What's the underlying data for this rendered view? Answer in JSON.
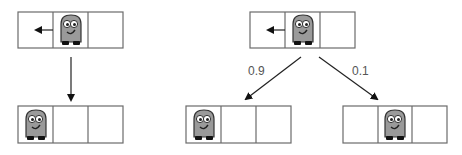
{
  "colors": {
    "grid_line": "#6b6b6b",
    "arrow": "#222222",
    "robot_body": "#9a9a9a",
    "robot_outline": "#333333",
    "robot_feet": "#111111",
    "label_text": "#555555"
  },
  "diagram": {
    "left_transition": {
      "start_state": {
        "robot_cell": 2,
        "action": "move-left"
      },
      "end_state": {
        "robot_cell": 1
      },
      "probability_label": ""
    },
    "right_transition": {
      "start_state": {
        "robot_cell": 2,
        "action": "move-left"
      },
      "outcomes": [
        {
          "robot_cell": 1,
          "probability": "0.9"
        },
        {
          "robot_cell": 2,
          "probability": "0.1"
        }
      ]
    }
  },
  "labels": {
    "prob_left": "0.9",
    "prob_right": "0.1"
  }
}
